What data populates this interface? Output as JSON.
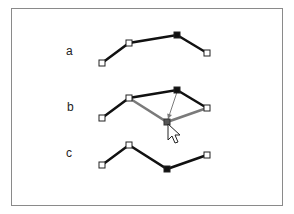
{
  "panels": [
    {
      "label": "a",
      "label_pos": [
        66,
        44
      ],
      "polyline": [
        [
          102,
          63
        ],
        [
          129,
          43
        ],
        [
          177,
          35
        ],
        [
          207,
          53
        ]
      ],
      "selected_index": 2
    },
    {
      "label": "b",
      "label_pos": [
        67,
        100
      ],
      "polyline": [
        [
          102,
          118
        ],
        [
          129,
          98
        ],
        [
          177,
          90
        ],
        [
          207,
          108
        ]
      ],
      "selected_index": 2,
      "drag_preview": [
        [
          129,
          98
        ],
        [
          167,
          122
        ],
        [
          207,
          108
        ]
      ],
      "drag_point": [
        167,
        122
      ],
      "drag_arrow": {
        "from": [
          177,
          92
        ],
        "to": [
          168,
          119
        ]
      },
      "cursor": [
        168,
        124
      ]
    },
    {
      "label": "c",
      "label_pos": [
        66,
        146
      ],
      "polyline": [
        [
          102,
          165
        ],
        [
          129,
          145
        ],
        [
          167,
          169
        ],
        [
          207,
          155
        ]
      ],
      "selected_index": 2
    }
  ],
  "colors": {
    "line": "#111111",
    "preview": "#7a7a7a",
    "handle_fill": "#ffffff",
    "handle_stroke": "#222222",
    "selected_fill": "#111111",
    "frame": "#8a8a8a"
  }
}
